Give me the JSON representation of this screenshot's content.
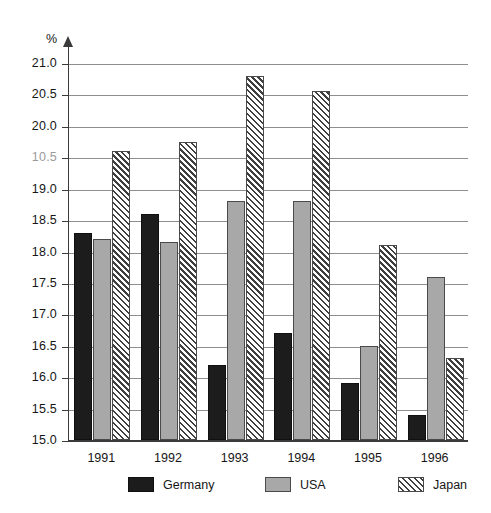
{
  "chart_data": {
    "type": "bar",
    "title": "",
    "xlabel": "",
    "ylabel": "%",
    "ylim": [
      15.0,
      21.0
    ],
    "ytick_step": 0.5,
    "grid": true,
    "legend_position": "bottom",
    "categories": [
      "1991",
      "1992",
      "1993",
      "1994",
      "1995",
      "1996"
    ],
    "ytick_labels": [
      "21.0",
      "20.5",
      "20.0",
      "10.5",
      "19.0",
      "18.5",
      "18.0",
      "17.5",
      "17.0",
      "16.5",
      "16.0",
      "15.5",
      "15.0"
    ],
    "ytick_values": [
      21.0,
      20.5,
      20.0,
      19.5,
      19.0,
      18.5,
      18.0,
      17.5,
      17.0,
      16.5,
      16.0,
      15.5,
      15.0
    ],
    "series": [
      {
        "name": "Germany",
        "color": "#1c1c1c",
        "fill": "solid-black",
        "values": [
          18.3,
          18.6,
          16.2,
          16.7,
          15.9,
          15.4
        ]
      },
      {
        "name": "USA",
        "color": "#a8a8a8",
        "fill": "solid-gray",
        "values": [
          18.2,
          18.15,
          18.8,
          18.8,
          16.5,
          17.6
        ]
      },
      {
        "name": "Japan",
        "color": "#ffffff",
        "fill": "diagonal-hatch",
        "values": [
          19.6,
          19.75,
          20.8,
          20.55,
          18.1,
          16.3
        ]
      }
    ]
  }
}
